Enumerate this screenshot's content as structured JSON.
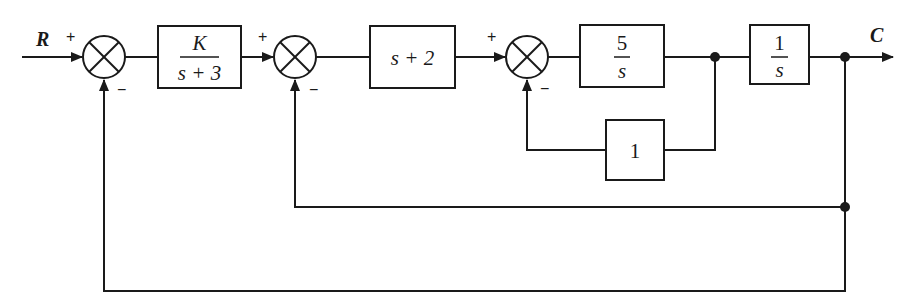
{
  "diagram": {
    "type": "control-system-block-diagram",
    "input_label": "R",
    "output_label": "C",
    "summing_junctions": [
      {
        "id": "sum1",
        "plus_sign": "+",
        "minus_sign": "−"
      },
      {
        "id": "sum2",
        "plus_sign": "+",
        "minus_sign": "−"
      },
      {
        "id": "sum3",
        "plus_sign": "+",
        "minus_sign": "−"
      }
    ],
    "blocks": {
      "controller": {
        "numerator": "K",
        "denominator": "s + 3"
      },
      "lead": {
        "text": "s + 2"
      },
      "forward_inner": {
        "numerator": "5",
        "denominator": "s"
      },
      "integrator": {
        "numerator": "1",
        "denominator": "s"
      },
      "inner_feedback": {
        "text": "1"
      }
    },
    "feedback_loops": [
      {
        "name": "inner",
        "from": "output of 5/s",
        "to": "sum3",
        "gain": "1"
      },
      {
        "name": "middle",
        "from": "C",
        "to": "sum2",
        "gain": "unity"
      },
      {
        "name": "outer",
        "from": "C",
        "to": "sum1",
        "gain": "unity"
      }
    ]
  }
}
